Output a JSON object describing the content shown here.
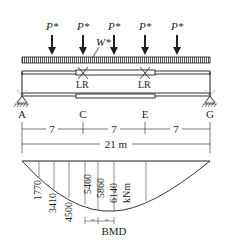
{
  "loads": {
    "point_load_label": "P*",
    "point_load_positions_x": [
      52,
      83,
      114,
      145,
      177
    ],
    "distributed_load_label": "W*"
  },
  "beam": {
    "nodes": [
      {
        "label": "A",
        "x": 22
      },
      {
        "label": "C",
        "x": 83
      },
      {
        "label": "E",
        "x": 145
      },
      {
        "label": "G",
        "x": 210
      }
    ],
    "lateral_restraints": [
      {
        "label": "LR",
        "x": 83
      },
      {
        "label": "LR",
        "x": 145
      }
    ]
  },
  "dimensions": {
    "segments": [
      "7",
      "7",
      "7"
    ],
    "total": "21 m"
  },
  "bmd": {
    "title": "BMD",
    "unit": "kNm",
    "values": [
      "1770",
      "3410",
      "4500",
      "5460",
      "5860",
      "6140"
    ],
    "spacing_label": "w"
  },
  "colors": {
    "ink": "#231f20",
    "background": "#ffffff"
  }
}
